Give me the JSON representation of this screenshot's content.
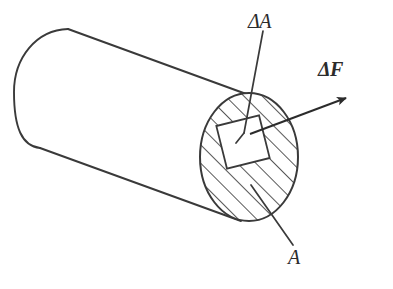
{
  "figure": {
    "kind": "engineering-diagram",
    "background_color": "#ffffff",
    "ink_color": "#3a3a3a",
    "labels": {
      "delta_area": "ΔA",
      "delta_force": "ΔF",
      "area": "A"
    },
    "elements": {
      "cylinder_name": "cylindrical bar",
      "cross_section_name": "hatched circular cross section",
      "patch_name": "small square area element",
      "force_arrow_name": "incremental force vector arrow"
    },
    "geometry": {
      "circle_center_x": 249,
      "circle_center_y": 157,
      "circle_radius_x": 49,
      "circle_radius_y": 64,
      "hatch_angle_deg": 45,
      "hatch_spacing_px": 13,
      "arrow_tip_x": 350,
      "arrow_tip_y": 96,
      "arrow_tail_x": 250,
      "arrow_tail_y": 134
    }
  }
}
